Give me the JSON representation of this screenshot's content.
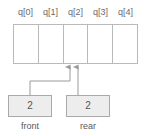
{
  "diagram": {
    "array": {
      "name": "q",
      "cell_labels": [
        "q[0]",
        "q[1]",
        "q[2]",
        "q[3]",
        "q[4]"
      ],
      "cell_values": [
        "",
        "",
        "",
        "",
        ""
      ],
      "cell_count": 5
    },
    "pointers": [
      {
        "id": "front",
        "label": "front",
        "value": "2",
        "points_to_index": 2
      },
      {
        "id": "rear",
        "label": "rear",
        "value": "2",
        "points_to_index": 2
      }
    ],
    "colors": {
      "background": "#ffffff",
      "cell_border": "#b9b9b9",
      "cell_fill": "#ffffff",
      "box_fill": "#ededed",
      "box_border": "#a9a9a9",
      "connector": "#9a9a9a",
      "text": "#555555"
    }
  }
}
